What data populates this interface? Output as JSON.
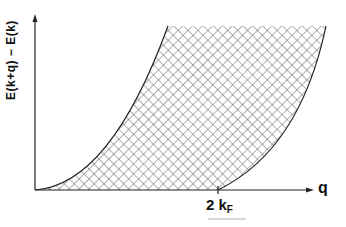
{
  "diagram": {
    "y_axis_label": "E(k+q) − E(k)",
    "x_axis_label": "q",
    "tick_label_main": "2 k",
    "tick_label_sub": "F",
    "colors": {
      "ink": "#222222",
      "background": "#ffffff"
    }
  }
}
